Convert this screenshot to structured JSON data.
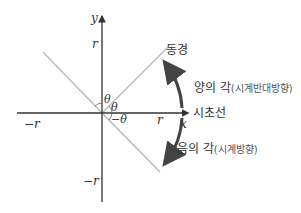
{
  "diagram": {
    "axes": {
      "x_label": "x",
      "y_label": "y"
    },
    "ticks": {
      "r_y": "r",
      "r_x": "r",
      "neg_r_x": "−r",
      "neg_r_y": "−r"
    },
    "angles": {
      "theta_upper": "θ",
      "theta_mid": "θ",
      "theta_neg": "−θ"
    },
    "labels": {
      "terminal_side": "동경",
      "initial_side": "시초선",
      "positive_angle": "양의 각",
      "positive_note": "(시계반대방향)",
      "negative_angle": "음의 각",
      "negative_note": "(시계방향)"
    },
    "colors": {
      "axis": "#333333",
      "ray": "#bbbbbb",
      "arc": "#444444"
    }
  }
}
